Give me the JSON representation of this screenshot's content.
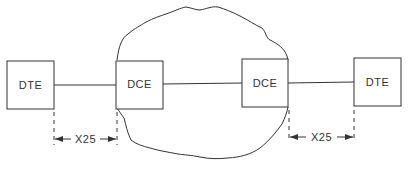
{
  "diagram": {
    "nodes": [
      {
        "id": "dte-left",
        "label": "DTE"
      },
      {
        "id": "dce-left",
        "label": "DCE"
      },
      {
        "id": "dce-right",
        "label": "DCE"
      },
      {
        "id": "dte-right",
        "label": "DTE"
      }
    ],
    "network": {
      "shape": "cloud"
    },
    "interfaces": [
      {
        "label": "X25",
        "between": [
          "dte-left",
          "dce-left"
        ]
      },
      {
        "label": "X25",
        "between": [
          "dce-right",
          "dte-right"
        ]
      }
    ],
    "colors": {
      "stroke": "#333333",
      "background": "#ffffff"
    }
  }
}
